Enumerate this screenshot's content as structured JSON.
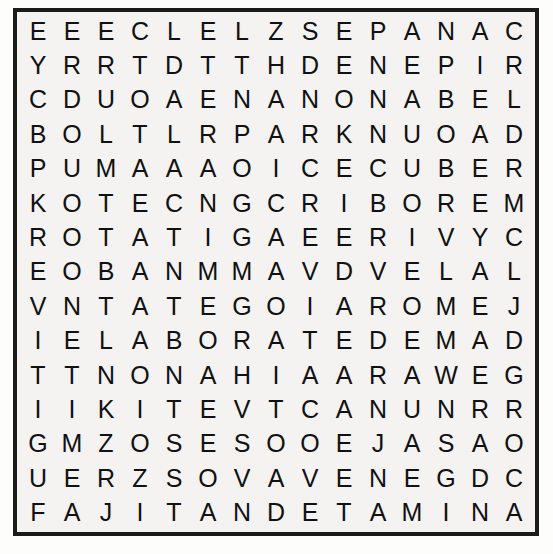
{
  "puzzle": {
    "type": "word-search",
    "rows": 15,
    "cols": 15,
    "border_color": "#1b1b1b",
    "paper_color": "#f4f3f1",
    "letter_color": "#111111",
    "grid": [
      [
        "E",
        "E",
        "E",
        "C",
        "L",
        "E",
        "L",
        "Z",
        "S",
        "E",
        "P",
        "A",
        "N",
        "A",
        "C"
      ],
      [
        "Y",
        "R",
        "R",
        "T",
        "D",
        "T",
        "T",
        "H",
        "D",
        "E",
        "N",
        "E",
        "P",
        "I",
        "R"
      ],
      [
        "C",
        "D",
        "U",
        "O",
        "A",
        "E",
        "N",
        "A",
        "N",
        "O",
        "N",
        "A",
        "B",
        "E",
        "L"
      ],
      [
        "B",
        "O",
        "L",
        "T",
        "L",
        "R",
        "P",
        "A",
        "R",
        "K",
        "N",
        "U",
        "O",
        "A",
        "D"
      ],
      [
        "P",
        "U",
        "M",
        "A",
        "A",
        "A",
        "O",
        "I",
        "C",
        "E",
        "C",
        "U",
        "B",
        "E",
        "R"
      ],
      [
        "K",
        "O",
        "T",
        "E",
        "C",
        "N",
        "G",
        "C",
        "R",
        "I",
        "B",
        "O",
        "R",
        "E",
        "M"
      ],
      [
        "R",
        "O",
        "T",
        "A",
        "T",
        "I",
        "G",
        "A",
        "E",
        "E",
        "R",
        "I",
        "V",
        "Y",
        "C"
      ],
      [
        "E",
        "O",
        "B",
        "A",
        "N",
        "M",
        "M",
        "A",
        "V",
        "D",
        "V",
        "E",
        "L",
        "A",
        "L"
      ],
      [
        "V",
        "N",
        "T",
        "A",
        "T",
        "E",
        "G",
        "O",
        "I",
        "A",
        "R",
        "O",
        "M",
        "E",
        "J"
      ],
      [
        "I",
        "E",
        "L",
        "A",
        "B",
        "O",
        "R",
        "A",
        "T",
        "E",
        "D",
        "E",
        "M",
        "A",
        "D"
      ],
      [
        "T",
        "T",
        "N",
        "O",
        "N",
        "A",
        "H",
        "I",
        "A",
        "A",
        "R",
        "A",
        "W",
        "E",
        "G"
      ],
      [
        "I",
        "I",
        "K",
        "I",
        "T",
        "E",
        "V",
        "T",
        "C",
        "A",
        "N",
        "U",
        "N",
        "R",
        "R"
      ],
      [
        "G",
        "M",
        "Z",
        "O",
        "S",
        "E",
        "S",
        "O",
        "O",
        "E",
        "J",
        "A",
        "S",
        "A",
        "O"
      ],
      [
        "U",
        "E",
        "R",
        "Z",
        "S",
        "O",
        "V",
        "A",
        "V",
        "E",
        "N",
        "E",
        "G",
        "D",
        "C"
      ],
      [
        "F",
        "A",
        "J",
        "I",
        "T",
        "A",
        "N",
        "D",
        "E",
        "T",
        "A",
        "M",
        "I",
        "N",
        "A"
      ]
    ]
  }
}
